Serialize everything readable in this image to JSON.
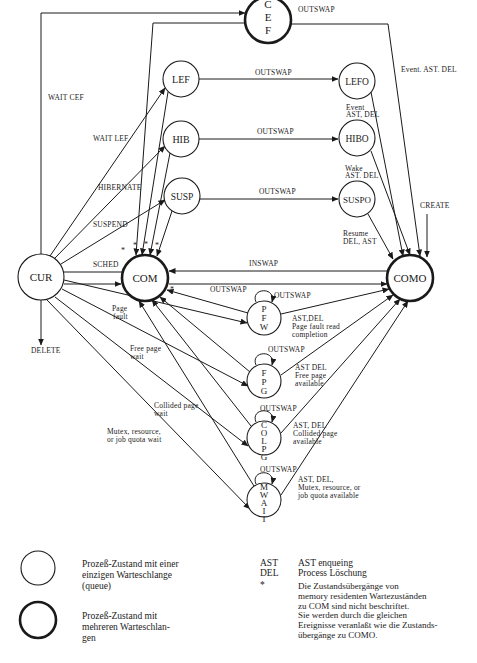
{
  "states": {
    "CEF": {
      "label": [
        "C",
        "E",
        "F"
      ],
      "multi_queue": true
    },
    "LEF": {
      "label": "LEF",
      "multi_queue": false
    },
    "HIB": {
      "label": "HIB",
      "multi_queue": false
    },
    "SUSP": {
      "label": "SUSP",
      "multi_queue": false
    },
    "CUR": {
      "label": "CUR",
      "multi_queue": false
    },
    "COM": {
      "label": "COM",
      "multi_queue": true
    },
    "LEFO": {
      "label": "LEFO",
      "multi_queue": false
    },
    "HIBO": {
      "label": "HIBO",
      "multi_queue": false
    },
    "SUSPO": {
      "label": "SUSPO",
      "multi_queue": false
    },
    "COMO": {
      "label": "COMO",
      "multi_queue": true
    },
    "PFW": {
      "label": [
        "P",
        "F",
        "W"
      ],
      "multi_queue": false
    },
    "FPG": {
      "label": [
        "F",
        "P",
        "G"
      ],
      "multi_queue": false
    },
    "COLPG": {
      "label": [
        "C",
        "O",
        "L",
        "P",
        "G"
      ],
      "multi_queue": false
    },
    "MWAIT": {
      "label": [
        "M",
        "W",
        "A",
        "I",
        "T"
      ],
      "multi_queue": false
    }
  },
  "edge_labels": {
    "wait_cef": "WAIT CEF",
    "wait_lef": "WAIT LEF",
    "hibernate": "HIBERNATE",
    "suspend": "SUSPEND",
    "sched": "SCHED",
    "delete": "DELETE",
    "page_fault": [
      "Page",
      "fault"
    ],
    "free_page_wait": [
      "Free page",
      "wait"
    ],
    "collided_page_wait": [
      "Collided page",
      "wait"
    ],
    "mutex_wait": [
      "Mutex, resource,",
      "or job quota wait"
    ],
    "outswap": "OUTSWAP",
    "inswap": "INSWAP",
    "create": "CREATE",
    "event_ast_del_cef": "Event. AST. DEL",
    "lefo_to_como": [
      "Event",
      "AST, DEL"
    ],
    "hibo_to_como": [
      "Wake",
      "AST. DEL"
    ],
    "suspo_to_como": [
      "Resume",
      "DEL, AST"
    ],
    "pfw_to_como": [
      "AST,DEL",
      "Page fault read",
      "completion"
    ],
    "fpg_to_como": [
      "AST DEL",
      "Free page",
      "available"
    ],
    "colpg_to_como": [
      "AST, DEL",
      "Collided page",
      "available"
    ],
    "mwait_to_como": [
      "AST, DEL,",
      "Mutex, resource, or",
      "job quota available"
    ],
    "star": "*"
  },
  "legend": {
    "single_queue": [
      "Prozeß-Zustand mit einer",
      "einzigen Warteschlange",
      "(queue)"
    ],
    "multi_queue": [
      "Prozeß-Zustand mit",
      "mehreren Warteschlan-",
      "gen"
    ]
  },
  "abbreviations": [
    {
      "key": "AST",
      "value": "AST enqueing"
    },
    {
      "key": "DEL",
      "value": "Process Löschung"
    },
    {
      "key": "*",
      "value": [
        "Die Zustandsübergänge von",
        "memory residenten Wartezuständen",
        "zu COM sind nicht beschriftet.",
        "Sie werden durch die gleichen",
        "Ereignisse veranlaßt wie die Zustands-",
        "übergänge zu COMO."
      ]
    }
  ]
}
